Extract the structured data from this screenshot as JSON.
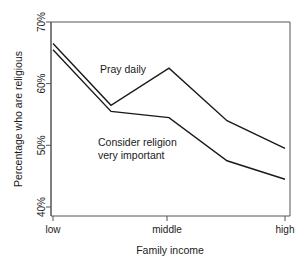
{
  "chart_data": {
    "type": "line",
    "title": "",
    "xlabel": "Family income",
    "ylabel": "Percentage who are religious",
    "x_categories": [
      "low",
      "middle",
      "high"
    ],
    "x_tick_labels": [
      "low",
      "middle",
      "high"
    ],
    "y_tick_labels": [
      "40%",
      "50%",
      "60%",
      "70%"
    ],
    "y_tick_values": [
      40,
      50,
      60,
      70
    ],
    "ylim": [
      38.5,
      70
    ],
    "xlim": [
      0,
      4
    ],
    "grid": false,
    "legend_position": "inline-annotations",
    "series": [
      {
        "name": "Pray daily",
        "label": "Pray daily",
        "x": [
          0,
          1,
          2,
          3,
          4
        ],
        "x_labels": [
          "low",
          "",
          "middle",
          "",
          "high"
        ],
        "values": [
          66.5,
          56.5,
          62.5,
          54.0,
          49.5
        ]
      },
      {
        "name": "Consider religion very important",
        "label_line1": "Consider religion",
        "label_line2": "very important",
        "x": [
          0,
          1,
          2,
          3,
          4
        ],
        "x_labels": [
          "low",
          "",
          "middle",
          "",
          "high"
        ],
        "values": [
          65.5,
          55.5,
          54.5,
          47.5,
          44.5
        ]
      }
    ],
    "annotations": [
      {
        "text": "Pray daily",
        "x_px": 100,
        "y_px": 73
      },
      {
        "text": "Consider religion",
        "x_px": 98,
        "y_px": 146
      },
      {
        "text": "very important",
        "x_px": 98,
        "y_px": 159
      }
    ],
    "colors": {
      "line": "#1a1a1a",
      "axis": "#555555",
      "background": "#ffffff"
    }
  }
}
